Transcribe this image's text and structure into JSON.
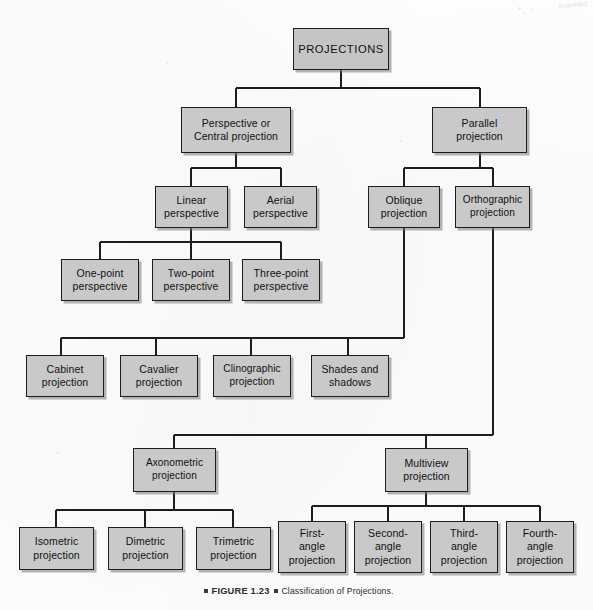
{
  "figure": {
    "number": "FIGURE 1.23",
    "caption": "Classification of Projections.",
    "watermark": "scanned"
  },
  "diagram": {
    "type": "tree",
    "title": "Classification of Projections",
    "nodes": {
      "projections": {
        "label": "PROJECTIONS",
        "x": 293,
        "y": 28,
        "w": 96,
        "h": 42
      },
      "perspective": {
        "label": "Perspective or\nCentral projection",
        "x": 181,
        "y": 107,
        "w": 110,
        "h": 46
      },
      "parallel": {
        "label": "Parallel\nprojection",
        "x": 432,
        "y": 107,
        "w": 95,
        "h": 46
      },
      "linear_perspective": {
        "label": "Linear\nperspective",
        "x": 155,
        "y": 186,
        "w": 73,
        "h": 42
      },
      "aerial_perspective": {
        "label": "Aerial\nperspective",
        "x": 244,
        "y": 186,
        "w": 73,
        "h": 42
      },
      "oblique": {
        "label": "Oblique\nprojection",
        "x": 368,
        "y": 186,
        "w": 72,
        "h": 42
      },
      "orthographic": {
        "label": "Orthographic\nprojection",
        "x": 455,
        "y": 186,
        "w": 75,
        "h": 42
      },
      "one_point": {
        "label": "One-point\nperspective",
        "x": 61,
        "y": 259,
        "w": 78,
        "h": 42
      },
      "two_point": {
        "label": "Two-point\nperspective",
        "x": 152,
        "y": 259,
        "w": 78,
        "h": 42
      },
      "three_point": {
        "label": "Three-point\nperspective",
        "x": 242,
        "y": 259,
        "w": 78,
        "h": 42
      },
      "cabinet": {
        "label": "Cabinet\nprojection",
        "x": 26,
        "y": 355,
        "w": 78,
        "h": 42
      },
      "cavalier": {
        "label": "Cavalier\nprojection",
        "x": 120,
        "y": 355,
        "w": 78,
        "h": 42
      },
      "clinographic": {
        "label": "Clinographic\nprojection",
        "x": 213,
        "y": 355,
        "w": 78,
        "h": 42
      },
      "shades": {
        "label": "Shades and\nshadows",
        "x": 311,
        "y": 355,
        "w": 78,
        "h": 42
      },
      "axonometric": {
        "label": "Axonometric\nprojection",
        "x": 133,
        "y": 448,
        "w": 83,
        "h": 44
      },
      "multiview": {
        "label": "Multiview\nprojection",
        "x": 385,
        "y": 448,
        "w": 83,
        "h": 44
      },
      "isometric": {
        "label": "Isometric\nprojection",
        "x": 19,
        "y": 527,
        "w": 75,
        "h": 43
      },
      "dimetric": {
        "label": "Dimetric\nprojection",
        "x": 108,
        "y": 527,
        "w": 75,
        "h": 43
      },
      "trimetric": {
        "label": "Trimetric\nprojection",
        "x": 196,
        "y": 527,
        "w": 75,
        "h": 43
      },
      "first_angle": {
        "label": "First-\nangle\nprojection",
        "x": 278,
        "y": 521,
        "w": 68,
        "h": 52
      },
      "second_angle": {
        "label": "Second-\nangle\nprojection",
        "x": 354,
        "y": 521,
        "w": 68,
        "h": 52
      },
      "third_angle": {
        "label": "Third-\nangle\nprojection",
        "x": 430,
        "y": 521,
        "w": 68,
        "h": 52
      },
      "fourth_angle": {
        "label": "Fourth-\nangle\nprojection",
        "x": 506,
        "y": 521,
        "w": 68,
        "h": 52
      }
    },
    "edges": [
      {
        "from": "projections",
        "to": "perspective"
      },
      {
        "from": "projections",
        "to": "parallel"
      },
      {
        "from": "perspective",
        "to": "linear_perspective"
      },
      {
        "from": "perspective",
        "to": "aerial_perspective"
      },
      {
        "from": "parallel",
        "to": "oblique"
      },
      {
        "from": "parallel",
        "to": "orthographic"
      },
      {
        "from": "linear_perspective",
        "to": "one_point"
      },
      {
        "from": "linear_perspective",
        "to": "two_point"
      },
      {
        "from": "linear_perspective",
        "to": "three_point"
      },
      {
        "from": "oblique",
        "to": "cabinet"
      },
      {
        "from": "oblique",
        "to": "cavalier"
      },
      {
        "from": "oblique",
        "to": "clinographic"
      },
      {
        "from": "oblique",
        "to": "shades"
      },
      {
        "from": "orthographic",
        "to": "axonometric"
      },
      {
        "from": "orthographic",
        "to": "multiview"
      },
      {
        "from": "axonometric",
        "to": "isometric"
      },
      {
        "from": "axonometric",
        "to": "dimetric"
      },
      {
        "from": "axonometric",
        "to": "trimetric"
      },
      {
        "from": "multiview",
        "to": "first_angle"
      },
      {
        "from": "multiview",
        "to": "second_angle"
      },
      {
        "from": "multiview",
        "to": "third_angle"
      },
      {
        "from": "multiview",
        "to": "fourth_angle"
      }
    ],
    "colors": {
      "node_fill": "#c9c9c9",
      "node_border": "#1d1d1d",
      "connector": "#1d1d1d",
      "background": "#fdfdfd",
      "text": "#101010"
    }
  }
}
